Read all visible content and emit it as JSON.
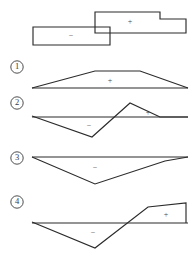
{
  "figure": {
    "title": "",
    "background_color": "#ffffff",
    "line_color": "#2b2b2b",
    "label_color": "#4a4a4a"
  },
  "prompt_diagram": {
    "name": "stepped-overlapping-rectangles",
    "negative_label": "−",
    "positive_label": "+",
    "negative_rect": {
      "x": 33,
      "y": 27,
      "width": 77,
      "height": 18
    },
    "positive_rect": {
      "x": 95,
      "y": 12,
      "width": 91,
      "height": 21
    },
    "notch": {
      "x": 160,
      "y": 12,
      "step_down_to_y": 19,
      "right_x": 186
    },
    "negative_label_pos": {
      "x": 71,
      "y": 36
    },
    "positive_label_pos": {
      "x": 130,
      "y": 22
    }
  },
  "options": [
    {
      "number": "①",
      "name": "option-1-trapezoid-positive",
      "marker_pos": {
        "x": 17,
        "y": 67
      },
      "baseline": {
        "x1": 32,
        "y1": 88,
        "x2": 188,
        "y2": 88
      },
      "polyline": "32,88 95,71 140,71 188,88",
      "sign_labels": [
        {
          "text": "+",
          "x": 110,
          "y": 81
        }
      ]
    },
    {
      "number": "②",
      "name": "option-2-negative-then-positive-triangles",
      "marker_pos": {
        "x": 17,
        "y": 103
      },
      "baseline": {
        "x1": 32,
        "y1": 117,
        "x2": 188,
        "y2": 117
      },
      "polyline": "32,116 92,137 130,103 160,117 188,117",
      "sign_labels": [
        {
          "text": "−",
          "x": 89,
          "y": 126
        },
        {
          "text": "+",
          "x": 148,
          "y": 113
        }
      ]
    },
    {
      "number": "③",
      "name": "option-3-downward-triangle-negative",
      "marker_pos": {
        "x": 17,
        "y": 158
      },
      "baseline": {
        "x1": 32,
        "y1": 157,
        "x2": 188,
        "y2": 157
      },
      "polyline": "32,157 95,184 165,161 188,157",
      "sign_labels": [
        {
          "text": "−",
          "x": 95,
          "y": 168
        }
      ]
    },
    {
      "number": "④",
      "name": "option-4-negative-triangle-then-rising-positive",
      "marker_pos": {
        "x": 17,
        "y": 202
      },
      "baseline": {
        "x1": 32,
        "y1": 223,
        "x2": 188,
        "y2": 223
      },
      "polyline": "32,222 95,248 148,207 186,203 186,223",
      "sign_labels": [
        {
          "text": "−",
          "x": 93,
          "y": 233
        },
        {
          "text": "+",
          "x": 166,
          "y": 215
        }
      ]
    }
  ]
}
